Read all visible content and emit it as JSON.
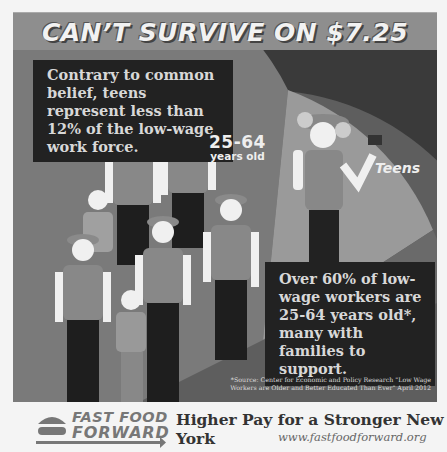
{
  "banner": {
    "title": "CAN’T SURVIVE ON $7.25"
  },
  "callouts": {
    "top": "Contrary to common belief, teens represent less than 12% of the low-wage work force.",
    "bottom": "Over 60% of low-wage workers are 25-64 years old*, many with families to support."
  },
  "pie": {
    "segments": [
      {
        "label": "25-64",
        "sublabel": "years old",
        "share": "over 60%",
        "color": "#777777"
      },
      {
        "label": "Teens",
        "share": "less than 12%",
        "color": "#999999"
      },
      {
        "label": "",
        "share": "remainder",
        "color": "#5e5e5e"
      }
    ]
  },
  "source": "*Source: Center for Economic and Policy Research \"Low Wage Workers are Older and Better Educated Than Ever\" April 2012",
  "footer": {
    "logo_line1": "FAST FOOD",
    "logo_line2": "FORWARD",
    "tagline": "Higher Pay for a Stronger New York",
    "url": "www.fastfoodforward.org"
  },
  "colors": {
    "banner": "#8e8e8e",
    "panel": "#3a3a3a",
    "callout_bg": "#222222",
    "footer_bg": "#f4f4f4"
  }
}
